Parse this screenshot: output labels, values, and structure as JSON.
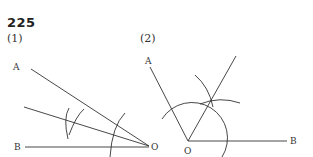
{
  "problem_number": "225",
  "figures": [
    {
      "label": "(1)",
      "points": {
        "A": "A",
        "B": "B",
        "O": "O"
      },
      "description": "Angle AOB with vertex O on the right; bisector constructed with compass arcs"
    },
    {
      "label": "(2)",
      "points": {
        "A": "A",
        "B": "B",
        "O": "O"
      },
      "description": "Angle AOB with vertex O at bottom; ray constructed from O through intersection of compass arcs"
    }
  ],
  "colors": {
    "ink": "#333333",
    "background": "#ffffff"
  }
}
